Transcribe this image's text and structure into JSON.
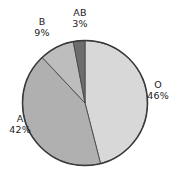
{
  "chart_data": {
    "type": "pie",
    "title": "",
    "subtitle": "",
    "xlabel": "",
    "ylabel": "",
    "legend_position": "none",
    "labels_position": "outside",
    "start_angle_deg": 0,
    "direction": "clockwise",
    "categories": [
      "O",
      "A",
      "B",
      "AB"
    ],
    "values": [
      46,
      42,
      9,
      3
    ],
    "value_unit": "%",
    "slices": [
      {
        "name": "O",
        "value": 46,
        "display_value": "46%",
        "color": "#d8d8d8",
        "start_deg": 0,
        "end_deg": 165.6
      },
      {
        "name": "A",
        "value": 42,
        "display_value": "42%",
        "color": "#b0b0b0",
        "start_deg": 165.6,
        "end_deg": 316.8
      },
      {
        "name": "B",
        "value": 9,
        "display_value": "9%",
        "color": "#bdbdbd",
        "start_deg": 316.8,
        "end_deg": 349.2
      },
      {
        "name": "AB",
        "value": 3,
        "display_value": "3%",
        "color": "#6d6d6d",
        "start_deg": 349.2,
        "end_deg": 360
      }
    ],
    "colors": {
      "o": "#d8d8d8",
      "a": "#b0b0b0",
      "b": "#bdbdbd",
      "ab": "#6d6d6d",
      "outline": "#3a3a3a",
      "divider": "#4a4a4a",
      "background": "#ffffff",
      "text": "#1b1b1b"
    },
    "geometry": {
      "center_x": 85,
      "center_y": 103,
      "radius": 62.5
    }
  }
}
